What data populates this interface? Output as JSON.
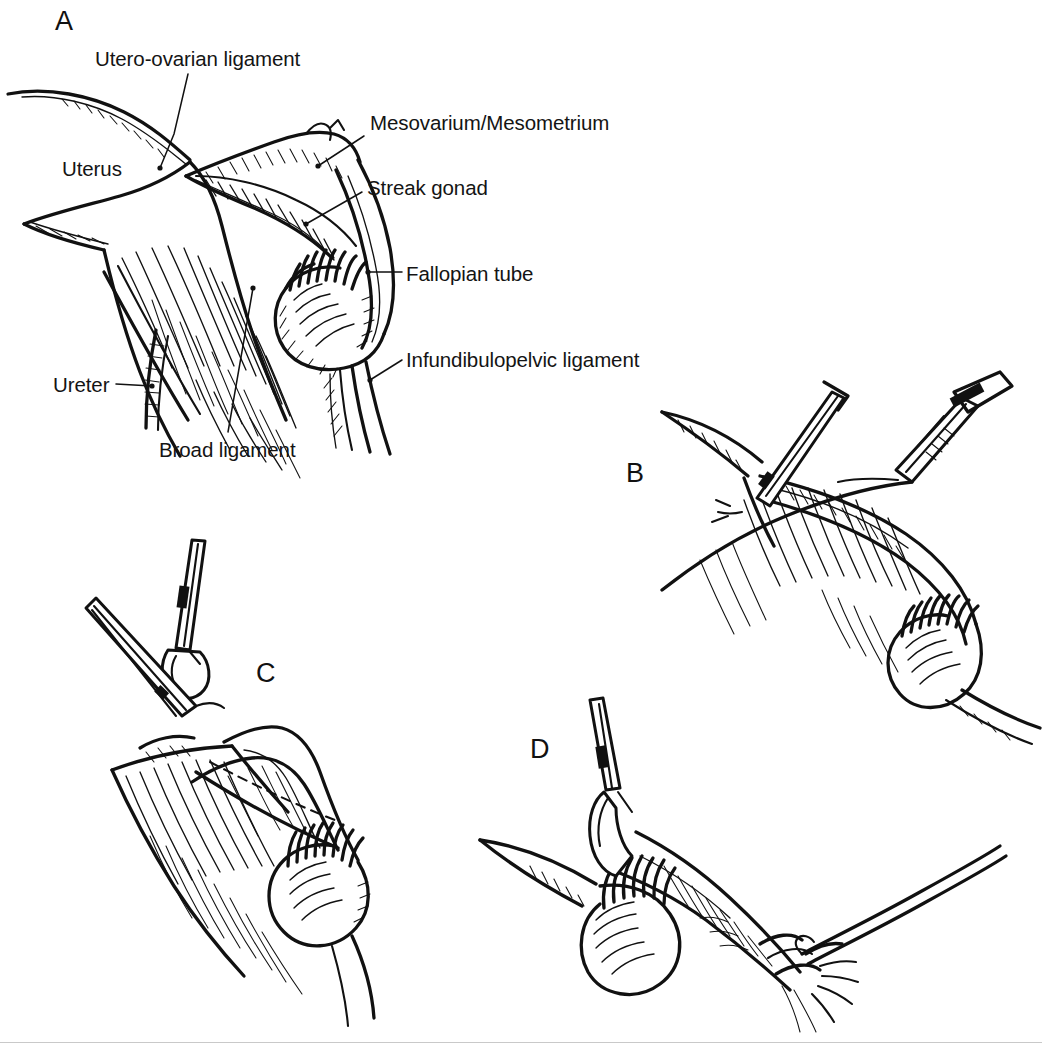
{
  "figure": {
    "kind": "medical-line-art-illustration",
    "background_color": "#ffffff",
    "ink_color": "#111111",
    "width": 1042,
    "height": 1043
  },
  "panels": [
    {
      "letter": "A",
      "caption": "Anatomy of the adnexa with streak gonad in situ",
      "annotations": [
        {
          "id": "utero-ovarian-ligament",
          "text": "Utero-ovarian ligament"
        },
        {
          "id": "uterus",
          "text": "Uterus"
        },
        {
          "id": "mesovarium-mesometrium",
          "text": "Mesovarium/Mesometrium"
        },
        {
          "id": "streak-gonad",
          "text": "Streak gonad"
        },
        {
          "id": "fallopian-tube",
          "text": "Fallopian tube"
        },
        {
          "id": "infundibulopelvic-ligament",
          "text": "Infundibulopelvic ligament"
        },
        {
          "id": "ureter",
          "text": "Ureter"
        },
        {
          "id": "broad-ligament",
          "text": "Broad ligament"
        }
      ]
    },
    {
      "letter": "B",
      "caption": "Clamps applied to utero-ovarian ligament and mesosalpinx",
      "annotations": []
    },
    {
      "letter": "C",
      "caption": "Specimen elevated, mesosalpinx divided",
      "annotations": []
    },
    {
      "letter": "D",
      "caption": "Pedicle ligated with free tie",
      "annotations": []
    }
  ]
}
